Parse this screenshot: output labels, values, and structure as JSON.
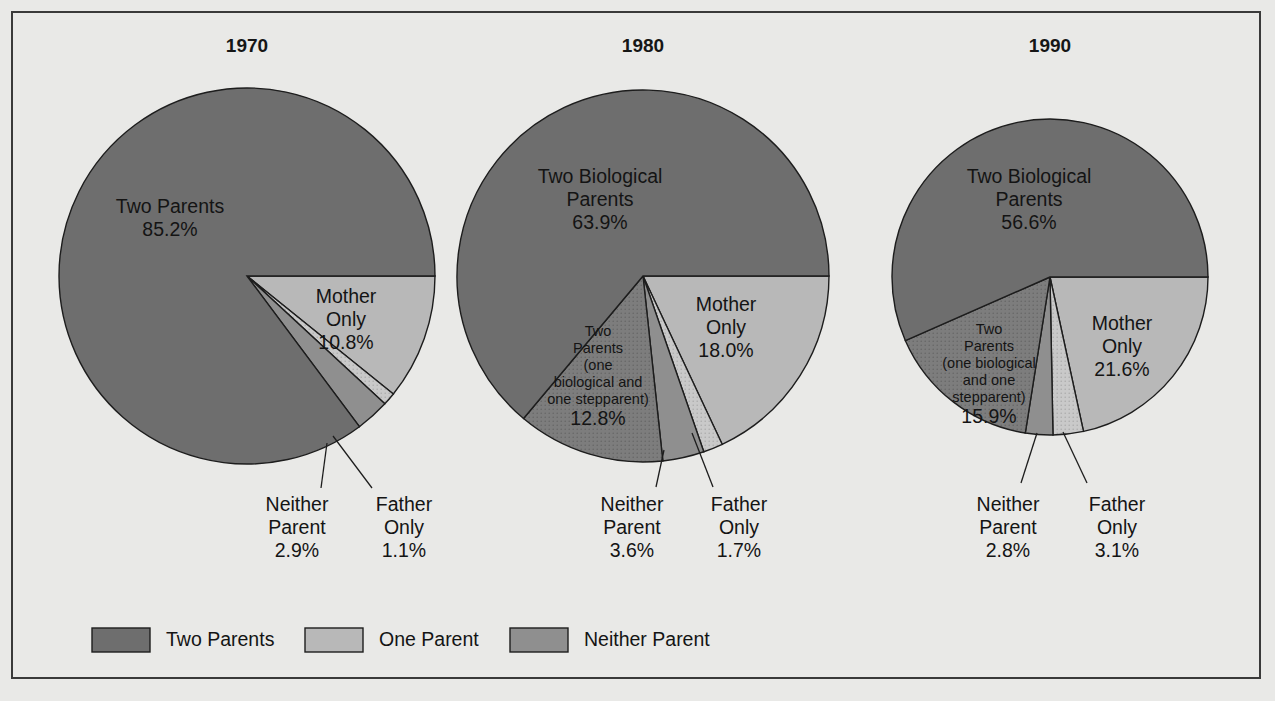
{
  "figure": {
    "background_color": "#e9e9e7",
    "frame_color": "#3a3a3a"
  },
  "colors": {
    "two_parents": "#6e6e6e",
    "two_parents_step": "#777777",
    "one_parent": "#b8b8b8",
    "mother_only": "#b8b8b8",
    "father_only": "#c9c9c9",
    "neither_parent": "#8f8f8f",
    "outline": "#1d1d1d",
    "text": "#141414"
  },
  "legend": {
    "items": [
      {
        "label": "Two Parents",
        "color": "#6e6e6e"
      },
      {
        "label": "One Parent",
        "color": "#b8b8b8"
      },
      {
        "label": "Neither Parent",
        "color": "#8f8f8f"
      }
    ]
  },
  "chart_data": {
    "type": "pie",
    "title": "",
    "charts": [
      {
        "title": "1970",
        "center": [
          247,
          276
        ],
        "radius": 188,
        "slices": [
          {
            "name": "Two Parents",
            "value": 85.2,
            "label": "Two Parents",
            "value_label": "85.2%",
            "color": "#6e6e6e",
            "label_pos": [
              170,
              213
            ],
            "label_kind": "inside"
          },
          {
            "name": "Mother Only",
            "value": 10.8,
            "label": "Mother\nOnly",
            "value_label": "10.8%",
            "color": "#b8b8b8",
            "label_pos": [
              346,
              303
            ],
            "label_kind": "inside"
          },
          {
            "name": "Father Only",
            "value": 1.1,
            "label": "Father\nOnly",
            "value_label": "1.1%",
            "color": "#c9c9c9",
            "label_pos": [
              404,
              511
            ],
            "label_kind": "callout",
            "leader": [
              [
                333,
                436
              ],
              [
                372,
                488
              ]
            ]
          },
          {
            "name": "Neither Parent",
            "value": 2.9,
            "label": "Neither\nParent",
            "value_label": "2.9%",
            "color": "#8f8f8f",
            "label_pos": [
              297,
              511
            ],
            "label_kind": "callout",
            "leader": [
              [
                327,
                443
              ],
              [
                321,
                488
              ]
            ]
          }
        ]
      },
      {
        "title": "1980",
        "center": [
          643,
          276
        ],
        "radius": 186,
        "slices": [
          {
            "name": "Two Biological Parents",
            "value": 63.9,
            "label": "Two Biological\nParents",
            "value_label": "63.9%",
            "color": "#6e6e6e",
            "label_pos": [
              600,
              183
            ],
            "label_kind": "inside"
          },
          {
            "name": "Mother Only",
            "value": 18.0,
            "label": "Mother\nOnly",
            "value_label": "18.0%",
            "color": "#b8b8b8",
            "label_pos": [
              726,
              311
            ],
            "label_kind": "inside"
          },
          {
            "name": "Father Only",
            "value": 1.7,
            "label": "Father\nOnly",
            "value_label": "1.7%",
            "color": "#c9c9c9",
            "label_pos": [
              739,
              511
            ],
            "label_kind": "callout",
            "leader": [
              [
                692,
                433
              ],
              [
                713,
                487
              ]
            ]
          },
          {
            "name": "Neither Parent",
            "value": 3.6,
            "label": "Neither\nParent",
            "value_label": "3.6%",
            "color": "#8f8f8f",
            "label_pos": [
              632,
              511
            ],
            "label_kind": "callout",
            "leader": [
              [
                664,
                450
              ],
              [
                656,
                487
              ]
            ]
          },
          {
            "name": "Two Parents (one biological and one stepparent)",
            "value": 12.8,
            "label": "Two\nParents\n(one\nbiological and\none stepparent)",
            "value_label": "12.8%",
            "color": "#777777",
            "label_pos": [
              598,
              336
            ],
            "label_kind": "inside-small"
          }
        ]
      },
      {
        "title": "1990",
        "center": [
          1050,
          277
        ],
        "radius": 158,
        "slices": [
          {
            "name": "Two Biological Parents",
            "value": 56.6,
            "label": "Two Biological\nParents",
            "value_label": "56.6%",
            "color": "#6e6e6e",
            "label_pos": [
              1029,
              183
            ],
            "label_kind": "inside"
          },
          {
            "name": "Mother Only",
            "value": 21.6,
            "label": "Mother\nOnly",
            "value_label": "21.6%",
            "color": "#b8b8b8",
            "label_pos": [
              1122,
              330
            ],
            "label_kind": "inside"
          },
          {
            "name": "Father Only",
            "value": 3.1,
            "label": "Father\nOnly",
            "value_label": "3.1%",
            "color": "#c9c9c9",
            "label_pos": [
              1117,
              511
            ],
            "label_kind": "callout",
            "leader": [
              [
                1063,
                432
              ],
              [
                1087,
                483
              ]
            ]
          },
          {
            "name": "Neither Parent",
            "value": 2.8,
            "label": "Neither\nParent",
            "value_label": "2.8%",
            "color": "#8f8f8f",
            "label_pos": [
              1008,
              511
            ],
            "label_kind": "callout",
            "leader": [
              [
                1037,
                433
              ],
              [
                1021,
                483
              ]
            ]
          },
          {
            "name": "Two Parents (one biological and one stepparent)",
            "value": 15.9,
            "label": "Two\nParents\n(one biological\nand one\nstepparent)",
            "value_label": "15.9%",
            "color": "#777777",
            "label_pos": [
              989,
              334
            ],
            "label_kind": "inside-small"
          }
        ]
      }
    ]
  }
}
